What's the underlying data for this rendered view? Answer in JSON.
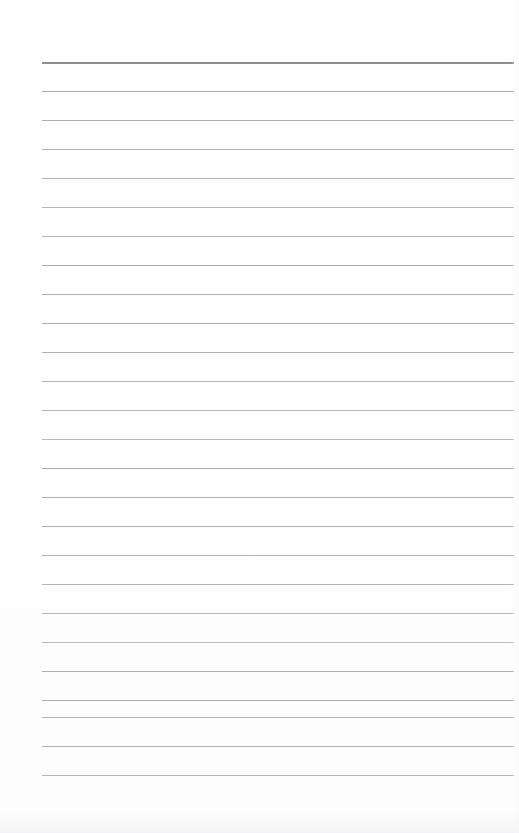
{
  "document": {
    "type": "scanned-ruled-page",
    "title": "Blank ruled notebook page",
    "page_width": 519,
    "page_height": 833,
    "background_color": "#fefefe",
    "has_handwriting": false,
    "has_printed_text": false,
    "visible_text": ""
  },
  "ruling": {
    "line_color": "#a9a9ad",
    "heavy_line_color": "#8e8e94",
    "line_thickness_px": 1,
    "heavy_line_thickness_px": 2,
    "line_spacing_px": 29,
    "first_line_y": 62,
    "last_line_y": 775,
    "line_left_x": 42,
    "line_right_x": 514,
    "line_count": 26,
    "line_y_positions": [
      62,
      91,
      120,
      149,
      178,
      207,
      236,
      265,
      294,
      323,
      352,
      381,
      410,
      439,
      468,
      497,
      526,
      555,
      584,
      613,
      642,
      671,
      700,
      717,
      746,
      775
    ],
    "heavy_line_indices": [
      0
    ]
  },
  "margins": {
    "top_margin_px": 62,
    "left_margin_px": 42,
    "right_margin_px": 5,
    "bottom_margin_px": 58,
    "has_vertical_margin_rule": false
  },
  "scan_artifacts": {
    "bottom_edge_noise": true,
    "right_edge_noise": true,
    "noise_color": "#f2f2f4"
  }
}
